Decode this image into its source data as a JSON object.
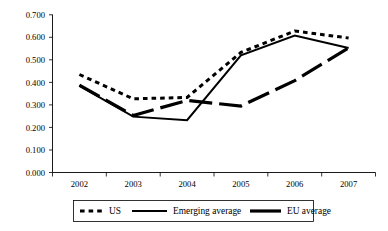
{
  "chart_data": {
    "type": "line",
    "title": "",
    "subtitle": "",
    "xlabel": "",
    "ylabel": "",
    "categories": [
      "2002",
      "2003",
      "2004",
      "2005",
      "2006",
      "2007"
    ],
    "x_tick_labels": [
      "2002",
      "2003",
      "2004",
      "2005",
      "2006",
      "2007"
    ],
    "y_tick_labels": [
      "0.000",
      "0.100",
      "0.200",
      "0.300",
      "0.400",
      "0.500",
      "0.600",
      "0.700"
    ],
    "y_tick_values": [
      0.0,
      0.1,
      0.2,
      0.3,
      0.4,
      0.5,
      0.6,
      0.7
    ],
    "ylim": [
      0.0,
      0.7
    ],
    "grid": false,
    "legend_position": "bottom",
    "series": [
      {
        "name": "US",
        "style": "dotted",
        "color": "#000000",
        "values": [
          0.435,
          0.327,
          0.333,
          0.533,
          0.628,
          0.597
        ]
      },
      {
        "name": "Emerging average",
        "style": "solid",
        "color": "#000000",
        "values": [
          0.385,
          0.248,
          0.232,
          0.52,
          0.608,
          0.553
        ]
      },
      {
        "name": "EU average",
        "style": "dashed-thick",
        "color": "#000000",
        "values": [
          0.388,
          0.253,
          0.32,
          0.295,
          0.408,
          0.553
        ]
      }
    ]
  },
  "legend": {
    "items": [
      {
        "label": "US",
        "swatch": "dotted-swatch"
      },
      {
        "label": "Emerging average",
        "swatch": "solid-swatch"
      },
      {
        "label": "EU average",
        "swatch": "thick-swatch"
      }
    ]
  }
}
